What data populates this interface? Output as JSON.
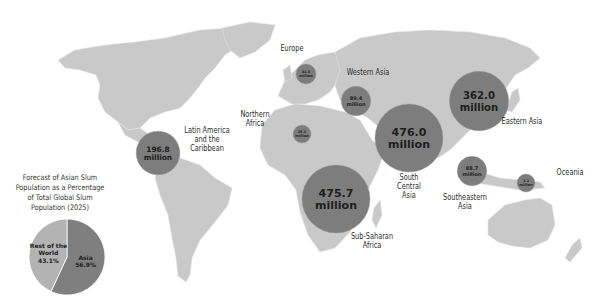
{
  "map_title": "Slum Population by Region",
  "units": "million",
  "colors": {
    "land": "#c9c9c9",
    "bubble": "#7d7d7d",
    "pie_asia": "#7f7f7f",
    "pie_rest": "#b3b3b3"
  },
  "regions": [
    {
      "name": "Latin America and the Caribbean",
      "label_lines": [
        "Latin America",
        "and the",
        "Caribbean"
      ],
      "value": 196.8,
      "value_text": "196.8",
      "unit_text": "million"
    },
    {
      "name": "Europe",
      "label_lines": [
        "Europe"
      ],
      "value": 41.8,
      "value_text": "41.8",
      "unit_text": "million"
    },
    {
      "name": "Western Asia",
      "label_lines": [
        "Western Asia"
      ],
      "value": 89.4,
      "value_text": "89.4",
      "unit_text": "million"
    },
    {
      "name": "Northern Africa",
      "label_lines": [
        "Northern",
        "Africa"
      ],
      "value": 25.1,
      "value_text": "25.1",
      "unit_text": "million"
    },
    {
      "name": "South Central Asia",
      "label_lines": [
        "South",
        "Central",
        "Asia"
      ],
      "value": 476.0,
      "value_text": "476.0",
      "unit_text": "million"
    },
    {
      "name": "Eastern Asia",
      "label_lines": [
        "Eastern Asia"
      ],
      "value": 362.0,
      "value_text": "362.0",
      "unit_text": "million"
    },
    {
      "name": "Southeastern Asia",
      "label_lines": [
        "Southeastern",
        "Asia"
      ],
      "value": 88.7,
      "value_text": "88.7",
      "unit_text": "million"
    },
    {
      "name": "Oceania",
      "label_lines": [
        "Oceania"
      ],
      "value": 1.1,
      "value_text": "1.1",
      "unit_text": "million"
    },
    {
      "name": "Sub-Saharan Africa",
      "label_lines": [
        "Sub-Saharan",
        "Africa"
      ],
      "value": 475.7,
      "value_text": "475.7",
      "unit_text": "million"
    }
  ],
  "pie": {
    "title_lines": [
      "Forecast of Asian Slum",
      "Population as a Percentage",
      "of Total Global Slum",
      "Population (2025)"
    ],
    "slices": [
      {
        "name": "Asia",
        "label": "Asia",
        "value": 56.9,
        "value_text": "56.9%"
      },
      {
        "name": "Rest of the World",
        "label_lines": [
          "Rest of the",
          "World"
        ],
        "value": 43.1,
        "value_text": "43.1%"
      }
    ]
  }
}
